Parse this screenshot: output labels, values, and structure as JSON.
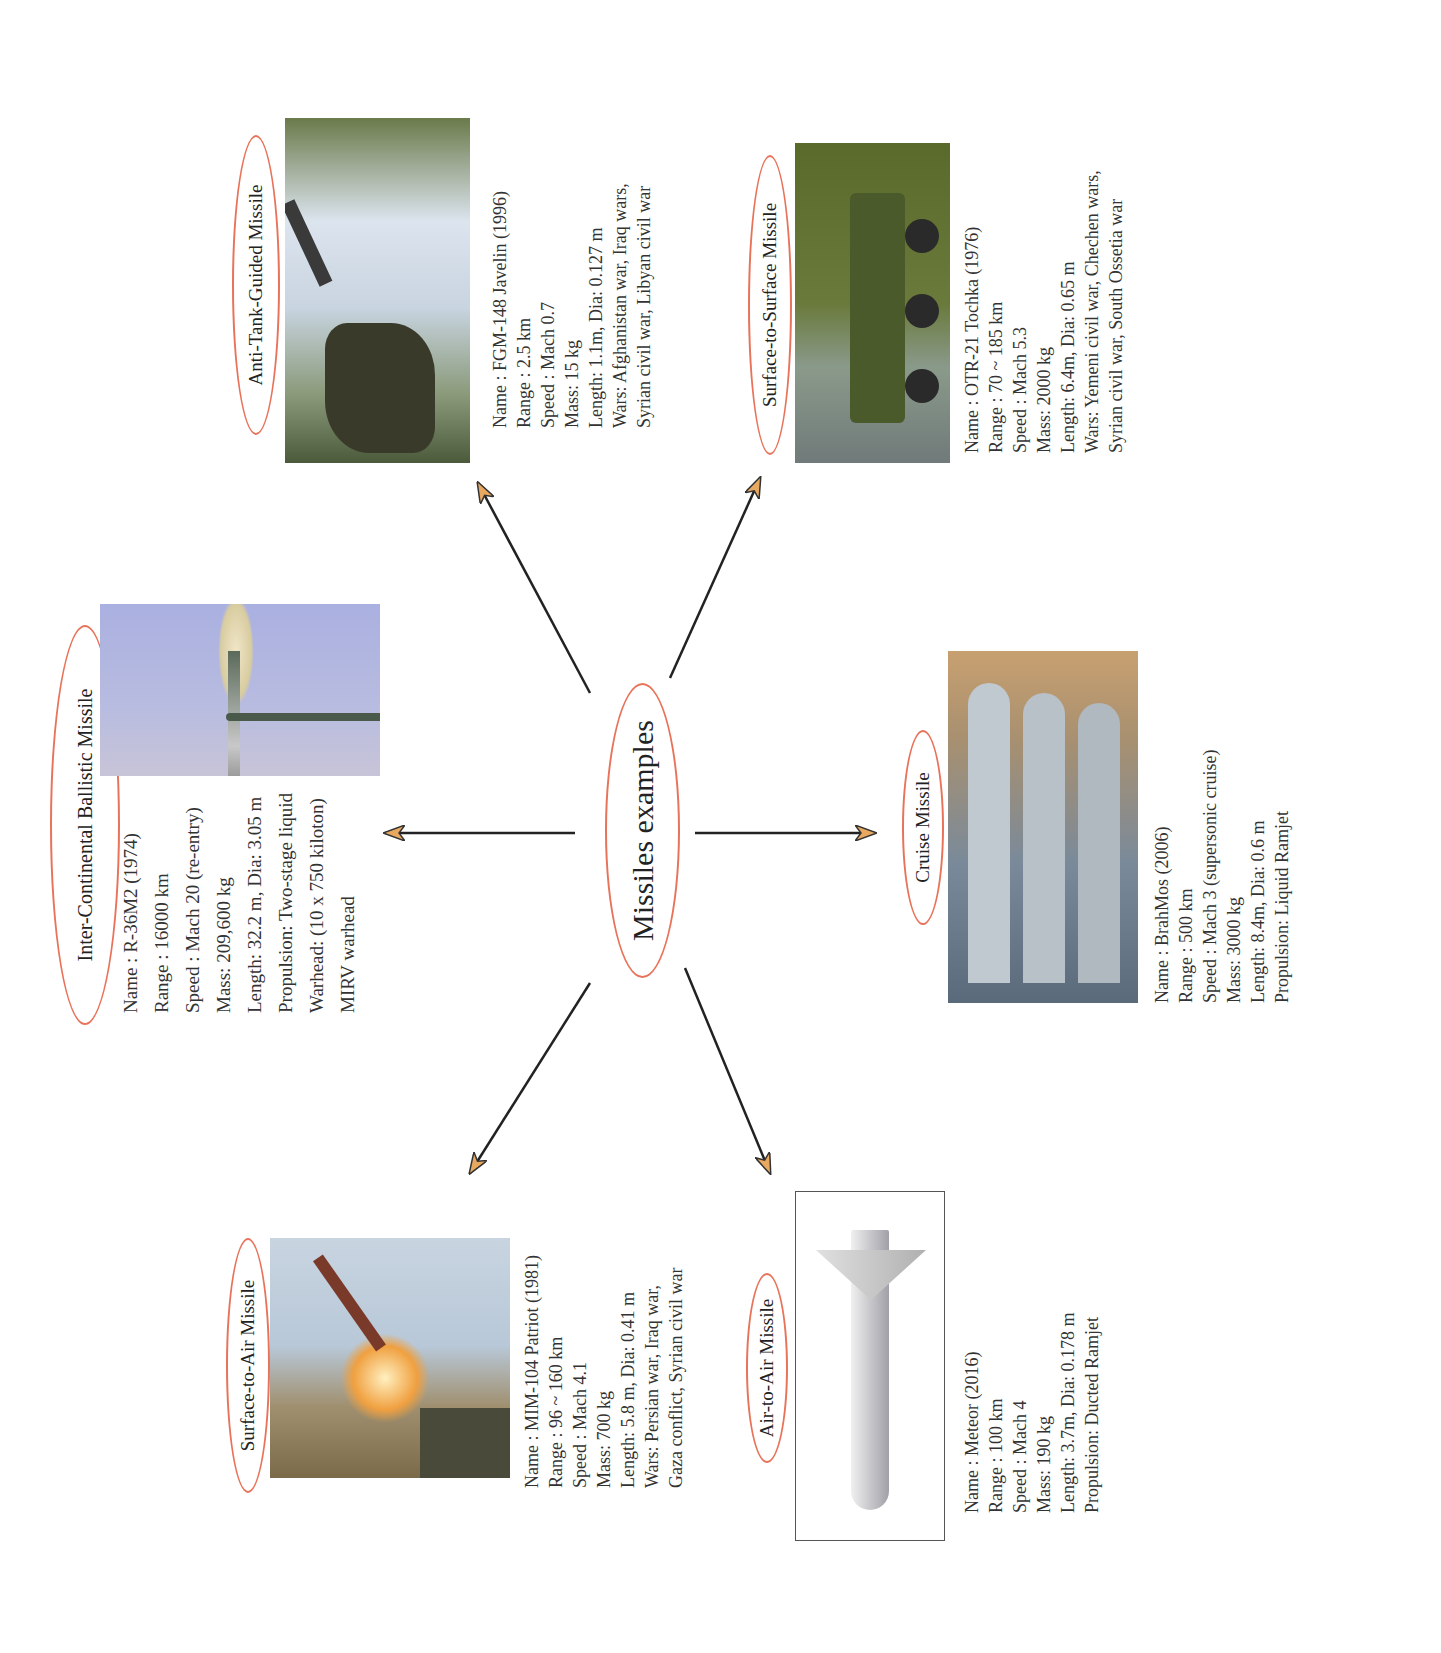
{
  "center": {
    "label": "Missiles examples"
  },
  "arrow_style": {
    "line_color": "#222222",
    "head_fill": "#e8a860",
    "head_stroke": "#333333",
    "oval_color": "#e8735a"
  },
  "missiles": [
    {
      "category": "Inter-Continental Ballistic Missile",
      "photo": "icbm-launch-photo",
      "lines": [
        "Name : R-36M2 (1974)",
        "Range : 16000 km",
        "Speed : Mach 20 (re-entry)",
        "Mass: 209,600 kg",
        "Length: 32.2 m, Dia: 3.05 m",
        "Propulsion: Two-stage liquid",
        "Warhead: (10 x 750 kiloton)",
        "MIRV warhead"
      ]
    },
    {
      "category": "Anti-Tank-Guided Missile",
      "photo": "javelin-soldier-photo",
      "lines": [
        "Name : FGM-148 Javelin (1996)",
        "Range : 2.5 km",
        "Speed : Mach 0.7",
        "Mass: 15 kg",
        "Length: 1.1m, Dia: 0.127 m",
        "Wars: Afghanistan war, Iraq wars,",
        "Syrian civil war, Libyan civil war"
      ]
    },
    {
      "category": "Surface-to-Surface Missile",
      "photo": "tochka-launcher-photo",
      "lines": [
        "Name : OTR-21 Tochka (1976)",
        "Range : 70 ~ 185 km",
        "Speed : Mach 5.3",
        "Mass: 2000 kg",
        "Length: 6.4m, Dia: 0.65 m",
        "Wars: Yemeni civil war, Chechen wars,",
        "Syrian civil war, South Ossetia war"
      ]
    },
    {
      "category": "Cruise Missile",
      "photo": "brahmos-parade-photo",
      "lines": [
        "Name : BrahMos (2006)",
        "Range : 500 km",
        "Speed : Mach 3 (supersonic cruise)",
        "Mass: 3000 kg",
        "Length: 8.4m, Dia: 0.6 m",
        "Propulsion: Liquid Ramjet"
      ]
    },
    {
      "category": "Air-to-Air Missile",
      "photo": "meteor-missile-photo",
      "lines": [
        "Name : Meteor (2016)",
        "Range : 100 km",
        "Speed : Mach 4",
        "Mass: 190 kg",
        "Length: 3.7m, Dia: 0.178 m",
        "Propulsion: Ducted Ramjet"
      ]
    },
    {
      "category": "Surface-to-Air Missile",
      "photo": "patriot-launch-photo",
      "lines": [
        "Name : MIM-104 Patriot (1981)",
        "Range : 96 ~ 160 km",
        "Speed : Mach 4.1",
        "Mass: 700 kg",
        "Length: 5.8 m, Dia: 0.41 m",
        "Wars: Persian war, Iraq war,",
        "Gaza conflict, Syrian civil war"
      ]
    }
  ]
}
